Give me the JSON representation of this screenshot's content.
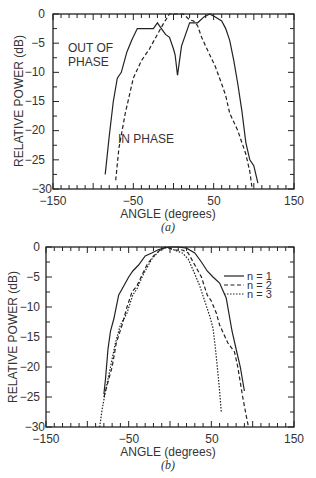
{
  "chart_data": [
    {
      "id": "a",
      "type": "line",
      "caption": "(a)",
      "xlabel": "ANGLE (degrees)",
      "ylabel": "RELATIVE POWER (dB)",
      "xlim": [
        -150,
        150
      ],
      "ylim": [
        -30,
        0
      ],
      "xticks": [
        -150,
        -50,
        50,
        150
      ],
      "yticks": [
        0,
        -5,
        -10,
        -15,
        -20,
        -25,
        -30
      ],
      "grid": false,
      "annotations": [
        {
          "text": "OUT OF",
          "x": -130,
          "y": -6
        },
        {
          "text": "PHASE",
          "x": -130,
          "y": -9
        },
        {
          "text": "IN PHASE",
          "x": -42,
          "y": -21.5
        }
      ],
      "series": [
        {
          "name": "OUT OF PHASE",
          "style": "solid",
          "x": [
            -85,
            -80,
            -75,
            -70,
            -65,
            -58,
            -52,
            -45,
            -35,
            -25,
            -20,
            -15,
            -10,
            -5,
            0,
            2,
            5,
            10,
            15,
            20,
            25,
            30,
            38,
            45,
            52,
            60,
            65,
            70,
            75,
            80,
            85,
            90,
            95,
            100,
            105
          ],
          "y": [
            -27.5,
            -21,
            -15,
            -11,
            -10,
            -6.5,
            -4.5,
            -2.5,
            -2.5,
            -2.5,
            -1.5,
            -2.5,
            -3.5,
            -4,
            -6,
            -7,
            -10.5,
            -5.5,
            -3.5,
            -1.5,
            -1.5,
            -1.5,
            -0.5,
            0,
            -0.5,
            -1.2,
            -2.5,
            -4.5,
            -8,
            -12,
            -16.5,
            -22,
            -25,
            -26,
            -29
          ]
        },
        {
          "name": "IN PHASE",
          "style": "dashed",
          "x": [
            -72,
            -68,
            -60,
            -55,
            -50,
            -40,
            -30,
            -20,
            -12,
            -5,
            5,
            12,
            20,
            25,
            30,
            35,
            45,
            52,
            60,
            65,
            70,
            80,
            90,
            95,
            98
          ],
          "y": [
            -28.5,
            -23,
            -17,
            -14,
            -11,
            -8,
            -6,
            -3.5,
            -1.5,
            0,
            0,
            0,
            -1,
            -1.2,
            -2,
            -4,
            -7,
            -9,
            -12,
            -14,
            -17,
            -20,
            -24,
            -27,
            -30
          ]
        }
      ]
    },
    {
      "id": "b",
      "type": "line",
      "caption": "(b)",
      "xlabel": "ANGLE (degrees)",
      "ylabel": "RELATIVE POWER (dB)",
      "xlim": [
        -150,
        150
      ],
      "ylim": [
        -30,
        0
      ],
      "xticks": [
        -150,
        -50,
        50,
        150
      ],
      "yticks": [
        0,
        -5,
        -10,
        -15,
        -20,
        -25,
        -30
      ],
      "grid": false,
      "legend": {
        "position": "upper right",
        "entries": [
          "n = 1",
          "n = 2",
          "n = 3"
        ]
      },
      "series": [
        {
          "name": "n = 1",
          "style": "solid",
          "x": [
            -80,
            -78,
            -75,
            -72,
            -68,
            -62,
            -58,
            -50,
            -45,
            -38,
            -30,
            -22,
            -15,
            -8,
            0,
            10,
            20,
            30,
            38,
            45,
            52,
            60,
            68,
            75,
            80,
            85,
            90
          ],
          "y": [
            -24.5,
            -22,
            -17,
            -14,
            -12,
            -8,
            -7,
            -5,
            -4,
            -3,
            -1.5,
            -1,
            -0.5,
            -0.2,
            0,
            0,
            -0.2,
            -1,
            -2.5,
            -4,
            -5,
            -6,
            -8.5,
            -14,
            -17,
            -20,
            -24
          ]
        },
        {
          "name": "n = 2",
          "style": "dashed",
          "x": [
            -80,
            -76,
            -70,
            -65,
            -58,
            -52,
            -46,
            -40,
            -35,
            -28,
            -20,
            -12,
            -5,
            5,
            15,
            22,
            30,
            38,
            45,
            50,
            56,
            60,
            70,
            78,
            82,
            88,
            92,
            95
          ],
          "y": [
            -25,
            -23,
            -20,
            -16,
            -13,
            -10,
            -7.5,
            -6.5,
            -5,
            -3,
            -1.5,
            -0.5,
            0,
            -0.5,
            -0.5,
            -1,
            -3,
            -5,
            -8,
            -9,
            -11,
            -13,
            -16,
            -17.5,
            -20,
            -25,
            -28,
            -30
          ]
        },
        {
          "name": "n = 3",
          "style": "dotted",
          "x": [
            -85,
            -82,
            -78,
            -72,
            -66,
            -60,
            -52,
            -45,
            -40,
            -32,
            -22,
            -12,
            -3,
            5,
            15,
            22,
            30,
            36,
            42,
            48,
            52,
            55,
            58,
            60,
            62
          ],
          "y": [
            -30,
            -27,
            -24,
            -20,
            -16,
            -13,
            -11,
            -8,
            -7,
            -4.5,
            -2,
            -0.5,
            0,
            -0.5,
            -1,
            -2,
            -4.5,
            -6.5,
            -9,
            -11.5,
            -13.5,
            -17,
            -21,
            -24,
            -27.5
          ]
        }
      ]
    }
  ],
  "charts": {
    "a": {
      "xlabel": "ANGLE (degrees)",
      "ylabel": "RELATIVE POWER (dB)",
      "caption": "(a)",
      "annotation_out_1": "OUT OF",
      "annotation_out_2": "PHASE",
      "annotation_in": "IN PHASE",
      "xtick_labels": [
        "−150",
        "−50",
        "50",
        "150"
      ],
      "ytick_labels": [
        "0",
        "−5",
        "−10",
        "−15",
        "−20",
        "−25",
        "−30"
      ]
    },
    "b": {
      "xlabel": "ANGLE (degrees)",
      "ylabel": "RELATIVE POWER (dB)",
      "caption": "(b)",
      "legend": [
        "n = 1",
        "n = 2",
        "n = 3"
      ],
      "xtick_labels": [
        "−150",
        "−50",
        "50",
        "150"
      ],
      "ytick_labels": [
        "0",
        "−5",
        "−10",
        "−15",
        "−20",
        "−25",
        "−30"
      ]
    }
  }
}
